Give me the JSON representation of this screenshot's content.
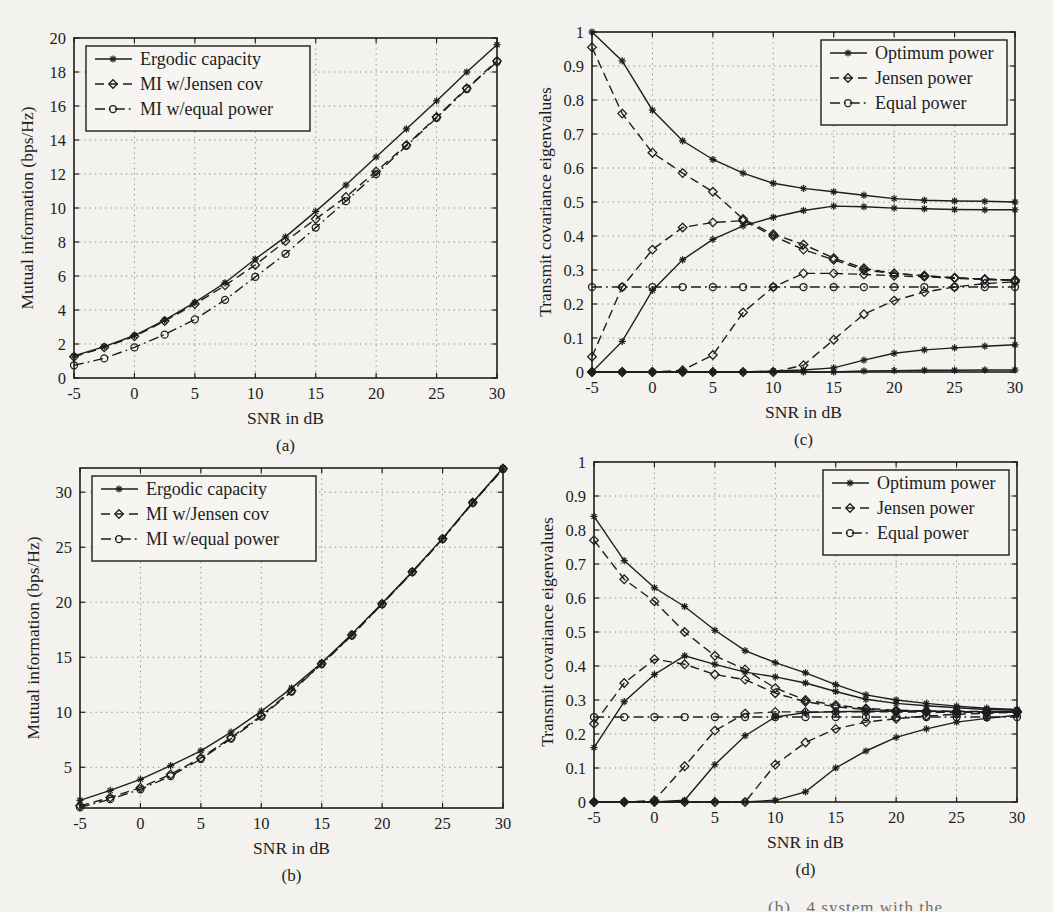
{
  "page": {
    "background": "#f3f2ee",
    "ink": "#1d1d1d",
    "grid_color": "#8a8a8a",
    "caption_fragment": "(b) . 4 system with the"
  },
  "chart_data": [
    {
      "id": "a",
      "type": "line",
      "sublabel": "(a)",
      "xlabel": "SNR in dB",
      "ylabel": "Mutual information (bps/Hz)",
      "xlim": [
        -5,
        30
      ],
      "ylim": [
        0,
        20
      ],
      "xticks": [
        -5,
        0,
        5,
        10,
        15,
        20,
        25,
        30
      ],
      "yticks": [
        0,
        2,
        4,
        6,
        8,
        10,
        12,
        14,
        16,
        18,
        20
      ],
      "grid": "dotted",
      "legend": {
        "pos": "top-left",
        "entries": [
          {
            "label": "Ergodic capacity",
            "style": "solid",
            "marker": "star"
          },
          {
            "label": "MI w/Jensen cov",
            "style": "dashed",
            "marker": "diamond"
          },
          {
            "label": "MI w/equal power",
            "style": "dashdot",
            "marker": "circle"
          }
        ]
      },
      "x": [
        -5,
        -2.5,
        0,
        2.5,
        5,
        7.5,
        10,
        12.5,
        15,
        17.5,
        20,
        22.5,
        25,
        27.5,
        30
      ],
      "series": [
        {
          "name": "MI w/equal power",
          "style": "dashdot",
          "marker": "circle",
          "values": [
            0.75,
            1.15,
            1.8,
            2.55,
            3.45,
            4.6,
            5.95,
            7.3,
            8.85,
            10.4,
            12.0,
            13.65,
            15.3,
            17.0,
            18.6
          ]
        },
        {
          "name": "MI w/Jensen cov",
          "style": "dashed",
          "marker": "diamond",
          "values": [
            1.25,
            1.8,
            2.45,
            3.35,
            4.35,
            5.45,
            6.65,
            8.05,
            9.35,
            10.65,
            12.15,
            13.7,
            15.35,
            17.05,
            18.65
          ]
        },
        {
          "name": "Ergodic capacity",
          "style": "solid",
          "marker": "star",
          "values": [
            1.3,
            1.85,
            2.5,
            3.4,
            4.45,
            5.6,
            7.0,
            8.3,
            9.8,
            11.35,
            13.0,
            14.65,
            16.3,
            18.0,
            19.6
          ]
        }
      ]
    },
    {
      "id": "b",
      "type": "line",
      "sublabel": "(b)",
      "xlabel": "SNR in dB",
      "ylabel": "Mutual information (bps/Hz)",
      "xlim": [
        -5,
        30
      ],
      "ylim": [
        1.3,
        32.2
      ],
      "xticks": [
        -5,
        0,
        5,
        10,
        15,
        20,
        25,
        30
      ],
      "yticks": [
        5,
        10,
        15,
        20,
        25,
        30
      ],
      "grid": "dotted",
      "legend": {
        "pos": "top-left",
        "entries": [
          {
            "label": "Ergodic capacity",
            "style": "solid",
            "marker": "star"
          },
          {
            "label": "MI w/Jensen cov",
            "style": "dashed",
            "marker": "diamond"
          },
          {
            "label": "MI w/equal power",
            "style": "dashdot",
            "marker": "circle"
          }
        ]
      },
      "x": [
        -5,
        -2.5,
        0,
        2.5,
        5,
        7.5,
        10,
        12.5,
        15,
        17.5,
        20,
        22.5,
        25,
        27.5,
        30
      ],
      "series": [
        {
          "name": "MI w/equal power",
          "style": "dashdot",
          "marker": "circle",
          "values": [
            1.35,
            2.1,
            3.0,
            4.2,
            5.75,
            7.6,
            9.6,
            11.88,
            14.38,
            16.98,
            19.82,
            22.73,
            25.73,
            29.03,
            32.1
          ]
        },
        {
          "name": "MI w/Jensen cov",
          "style": "dashed",
          "marker": "diamond",
          "values": [
            1.5,
            2.25,
            3.15,
            4.35,
            5.85,
            7.7,
            9.7,
            11.95,
            14.42,
            17.02,
            19.85,
            22.76,
            25.76,
            29.06,
            32.15
          ]
        },
        {
          "name": "Ergodic capacity",
          "style": "solid",
          "marker": "star",
          "values": [
            2.0,
            2.9,
            3.9,
            5.15,
            6.5,
            8.2,
            10.1,
            12.2,
            14.5,
            17.1,
            19.9,
            22.8,
            25.8,
            29.1,
            32.2
          ]
        }
      ]
    },
    {
      "id": "c",
      "type": "line",
      "sublabel": "(c)",
      "xlabel": "SNR in dB",
      "ylabel": "Transmit covariance eigenvalues",
      "xlim": [
        -5,
        30
      ],
      "ylim": [
        0,
        1
      ],
      "xticks": [
        -5,
        0,
        5,
        10,
        15,
        20,
        25,
        30
      ],
      "yticks": [
        0,
        0.1,
        0.2,
        0.3,
        0.4,
        0.5,
        0.6,
        0.7,
        0.8,
        0.9,
        1
      ],
      "ytick_labels": [
        "0",
        "0.1",
        "0.2",
        "0.3",
        "0.4",
        "0.5",
        "0.6",
        "0.7",
        "0.8",
        "0.9",
        "1"
      ],
      "grid": "dotted",
      "legend": {
        "pos": "top-right",
        "entries": [
          {
            "label": "Optimum power",
            "style": "solid",
            "marker": "star"
          },
          {
            "label": "Jensen power",
            "style": "dashed",
            "marker": "diamond"
          },
          {
            "label": "Equal power",
            "style": "dashdot",
            "marker": "circle"
          }
        ]
      },
      "x": [
        -5,
        -2.5,
        0,
        2.5,
        5,
        7.5,
        10,
        12.5,
        15,
        17.5,
        20,
        22.5,
        25,
        27.5,
        30
      ],
      "series": [
        {
          "name": "Equal power eig 1-4",
          "style": "dashdot",
          "marker": "circle",
          "values": [
            0.25,
            0.25,
            0.25,
            0.25,
            0.25,
            0.25,
            0.25,
            0.25,
            0.25,
            0.25,
            0.25,
            0.25,
            0.25,
            0.25,
            0.25
          ]
        },
        {
          "name": "Jensen power eig 1",
          "style": "dashed",
          "marker": "diamond",
          "values": [
            0.955,
            0.76,
            0.645,
            0.585,
            0.53,
            0.45,
            0.405,
            0.375,
            0.335,
            0.305,
            0.29,
            0.283,
            0.277,
            0.273,
            0.27
          ]
        },
        {
          "name": "Jensen power eig 2",
          "style": "dashed",
          "marker": "diamond",
          "values": [
            0.045,
            0.25,
            0.36,
            0.425,
            0.44,
            0.445,
            0.4,
            0.36,
            0.33,
            0.3,
            0.29,
            0.283,
            0.277,
            0.273,
            0.27
          ]
        },
        {
          "name": "Jensen power eig 3",
          "style": "dashed",
          "marker": "diamond",
          "values": [
            0,
            0,
            0,
            0.005,
            0.05,
            0.175,
            0.25,
            0.29,
            0.29,
            0.287,
            0.283,
            0.28,
            0.276,
            0.272,
            0.27
          ]
        },
        {
          "name": "Jensen power eig 4",
          "style": "dashed",
          "marker": "diamond",
          "values": [
            0,
            0,
            0,
            0,
            0,
            0,
            0,
            0.02,
            0.095,
            0.17,
            0.21,
            0.235,
            0.25,
            0.26,
            0.265
          ]
        },
        {
          "name": "Optimum power eig 1",
          "style": "solid",
          "marker": "star",
          "values": [
            1.0,
            0.915,
            0.77,
            0.68,
            0.625,
            0.585,
            0.555,
            0.54,
            0.53,
            0.52,
            0.51,
            0.505,
            0.503,
            0.502,
            0.5
          ]
        },
        {
          "name": "Optimum power eig 2",
          "style": "solid",
          "marker": "star",
          "values": [
            0,
            0.09,
            0.24,
            0.33,
            0.39,
            0.43,
            0.455,
            0.475,
            0.488,
            0.486,
            0.482,
            0.48,
            0.478,
            0.477,
            0.477
          ]
        },
        {
          "name": "Optimum power eig 3",
          "style": "solid",
          "marker": "star",
          "values": [
            0,
            0,
            0,
            0,
            0,
            0,
            0.003,
            0.006,
            0.012,
            0.035,
            0.055,
            0.065,
            0.071,
            0.076,
            0.08
          ]
        },
        {
          "name": "Optimum power eig 4",
          "style": "solid",
          "marker": "star",
          "values": [
            0,
            0,
            0,
            0,
            0,
            0,
            0,
            0,
            0,
            0.003,
            0.004,
            0.005,
            0.005,
            0.006,
            0.006
          ]
        }
      ]
    },
    {
      "id": "d",
      "type": "line",
      "sublabel": "(d)",
      "xlabel": "SNR in dB",
      "ylabel": "Transmit covariance eigenvalues",
      "xlim": [
        -5,
        30
      ],
      "ylim": [
        0,
        1
      ],
      "xticks": [
        -5,
        0,
        5,
        10,
        15,
        20,
        25,
        30
      ],
      "yticks": [
        0,
        0.1,
        0.2,
        0.3,
        0.4,
        0.5,
        0.6,
        0.7,
        0.8,
        0.9,
        1
      ],
      "ytick_labels": [
        "0",
        "0.1",
        "0.2",
        "0.3",
        "0.4",
        "0.5",
        "0.6",
        "0.7",
        "0.8",
        "0.9",
        "1"
      ],
      "grid": "dotted",
      "legend": {
        "pos": "top-right",
        "entries": [
          {
            "label": "Optimum power",
            "style": "solid",
            "marker": "star"
          },
          {
            "label": "Jensen power",
            "style": "dashed",
            "marker": "diamond"
          },
          {
            "label": "Equal power",
            "style": "dashdot",
            "marker": "circle"
          }
        ]
      },
      "x": [
        -5,
        -2.5,
        0,
        2.5,
        5,
        7.5,
        10,
        12.5,
        15,
        17.5,
        20,
        22.5,
        25,
        27.5,
        30
      ],
      "series": [
        {
          "name": "Equal power eig 1-4",
          "style": "dashdot",
          "marker": "circle",
          "values": [
            0.25,
            0.25,
            0.25,
            0.25,
            0.25,
            0.25,
            0.25,
            0.25,
            0.25,
            0.25,
            0.25,
            0.25,
            0.25,
            0.25,
            0.25
          ]
        },
        {
          "name": "Jensen power eig 1",
          "style": "dashed",
          "marker": "diamond",
          "values": [
            0.77,
            0.655,
            0.59,
            0.5,
            0.43,
            0.39,
            0.335,
            0.3,
            0.285,
            0.275,
            0.27,
            0.268,
            0.267,
            0.266,
            0.266
          ]
        },
        {
          "name": "Jensen power eig 2",
          "style": "dashed",
          "marker": "diamond",
          "values": [
            0.23,
            0.35,
            0.42,
            0.405,
            0.375,
            0.36,
            0.32,
            0.295,
            0.28,
            0.272,
            0.268,
            0.267,
            0.266,
            0.266,
            0.266
          ]
        },
        {
          "name": "Jensen power eig 3",
          "style": "dashed",
          "marker": "diamond",
          "values": [
            0,
            0,
            0.005,
            0.105,
            0.21,
            0.26,
            0.265,
            0.265,
            0.265,
            0.265,
            0.265,
            0.264,
            0.264,
            0.264,
            0.264
          ]
        },
        {
          "name": "Jensen power eig 4",
          "style": "dashed",
          "marker": "diamond",
          "values": [
            0,
            0,
            0,
            0,
            0,
            0,
            0.11,
            0.175,
            0.215,
            0.235,
            0.245,
            0.253,
            0.258,
            0.261,
            0.264
          ]
        },
        {
          "name": "Optimum power eig 1",
          "style": "solid",
          "marker": "star",
          "values": [
            0.84,
            0.71,
            0.63,
            0.575,
            0.505,
            0.445,
            0.41,
            0.38,
            0.345,
            0.315,
            0.3,
            0.29,
            0.282,
            0.276,
            0.272
          ]
        },
        {
          "name": "Optimum power eig 2",
          "style": "solid",
          "marker": "star",
          "values": [
            0.16,
            0.295,
            0.375,
            0.43,
            0.405,
            0.382,
            0.368,
            0.35,
            0.325,
            0.302,
            0.29,
            0.283,
            0.277,
            0.272,
            0.27
          ]
        },
        {
          "name": "Optimum power eig 3",
          "style": "solid",
          "marker": "star",
          "values": [
            0,
            0,
            0,
            0.005,
            0.11,
            0.195,
            0.25,
            0.263,
            0.266,
            0.267,
            0.267,
            0.267,
            0.266,
            0.266,
            0.266
          ]
        },
        {
          "name": "Optimum power eig 4",
          "style": "solid",
          "marker": "star",
          "values": [
            0,
            0,
            0,
            0,
            0,
            0,
            0.005,
            0.03,
            0.1,
            0.15,
            0.19,
            0.215,
            0.235,
            0.246,
            0.255
          ]
        }
      ]
    }
  ]
}
